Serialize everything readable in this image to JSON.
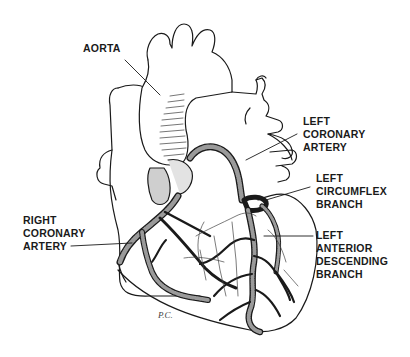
{
  "diagram": {
    "labels": [
      {
        "id": "aorta",
        "lines": [
          "AORTA"
        ]
      },
      {
        "id": "left-coronary-artery",
        "lines": [
          "LEFT",
          "CORONARY",
          "ARTERY"
        ]
      },
      {
        "id": "left-circumflex-branch",
        "lines": [
          "LEFT",
          "CIRCUMFLEX",
          "BRANCH"
        ]
      },
      {
        "id": "right-coronary-artery",
        "lines": [
          "RIGHT",
          "CORONARY",
          "ARTERY"
        ]
      },
      {
        "id": "left-anterior-descending-branch",
        "lines": [
          "LEFT",
          "ANTERIOR",
          "DESCENDING",
          "BRANCH"
        ]
      }
    ],
    "artist_initials": "P.C.",
    "colors": {
      "ink": "#1a1a1a",
      "background": "#ffffff"
    }
  }
}
